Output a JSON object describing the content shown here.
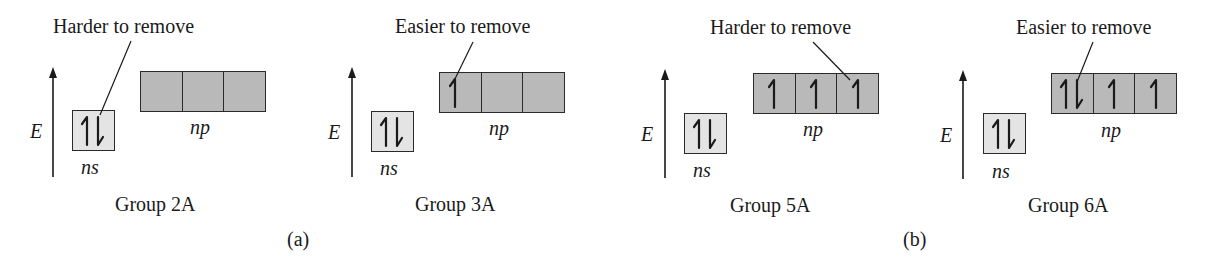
{
  "colors": {
    "ns_fill": "#e4e4e4",
    "np_fill": "#b9b9b9",
    "stroke": "#2a2a2a"
  },
  "labels": {
    "energy_axis": "E",
    "ns": "ns",
    "np": "np"
  },
  "parts": [
    {
      "id": "a",
      "label": "(a)"
    },
    {
      "id": "b",
      "label": "(b)"
    }
  ],
  "panels": [
    {
      "group": "Group 2A",
      "annotation": "Harder to remove",
      "annotation_target": "ns",
      "ns_electrons": [
        "up",
        "down"
      ],
      "np_electrons": [
        [],
        [],
        []
      ]
    },
    {
      "group": "Group 3A",
      "annotation": "Easier to remove",
      "annotation_target": "np-1",
      "ns_electrons": [
        "up",
        "down"
      ],
      "np_electrons": [
        [
          "up"
        ],
        [],
        []
      ]
    },
    {
      "group": "Group 5A",
      "annotation": "Harder to remove",
      "annotation_target": "np-3",
      "ns_electrons": [
        "up",
        "down"
      ],
      "np_electrons": [
        [
          "up"
        ],
        [
          "up"
        ],
        [
          "up"
        ]
      ]
    },
    {
      "group": "Group 6A",
      "annotation": "Easier to remove",
      "annotation_target": "np-1",
      "ns_electrons": [
        "up",
        "down"
      ],
      "np_electrons": [
        [
          "up",
          "down"
        ],
        [
          "up"
        ],
        [
          "up"
        ]
      ]
    }
  ]
}
